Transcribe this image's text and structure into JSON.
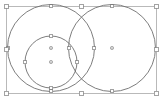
{
  "app": {
    "view_name": "vector-canvas",
    "background_color": "#ffffff"
  },
  "canvas": {
    "width": 162,
    "height": 104,
    "units": "px"
  },
  "selection": {
    "bbox": {
      "x": 6,
      "y": 6,
      "width": 150,
      "height": 87,
      "stroke_color": "#b9b9b9",
      "stroke_width": 1
    },
    "handle_style": {
      "size": 4,
      "fill": "#ffffff",
      "stroke": "#8c8c8c"
    },
    "handles": [
      {
        "name": "handle-top-left",
        "x": 6,
        "y": 6
      },
      {
        "name": "handle-top-center",
        "x": 81,
        "y": 6
      },
      {
        "name": "handle-top-right",
        "x": 156,
        "y": 6
      },
      {
        "name": "handle-middle-left",
        "x": 6,
        "y": 49.5
      },
      {
        "name": "handle-middle-right",
        "x": 156,
        "y": 49.5
      },
      {
        "name": "handle-bottom-left",
        "x": 6,
        "y": 93
      },
      {
        "name": "handle-bottom-center",
        "x": 81,
        "y": 93
      },
      {
        "name": "handle-bottom-right",
        "x": 156,
        "y": 93
      }
    ]
  },
  "shapes": [
    {
      "id": "circle-large-left",
      "type": "circle",
      "cx": 51,
      "cy": 48,
      "r": 43.5,
      "stroke_color": "#6e6e6e",
      "stroke_width": 0.9,
      "fill": "none"
    },
    {
      "id": "circle-large-right",
      "type": "circle",
      "cx": 112,
      "cy": 48,
      "r": 43.5,
      "stroke_color": "#6e6e6e",
      "stroke_width": 0.9,
      "fill": "none"
    },
    {
      "id": "circle-small",
      "type": "circle",
      "cx": 51,
      "cy": 62,
      "r": 26,
      "stroke_color": "#6e6e6e",
      "stroke_width": 0.9,
      "fill": "none"
    }
  ],
  "center_markers": [
    {
      "name": "center-marker-large-left",
      "x": 51,
      "y": 48
    },
    {
      "name": "center-marker-small",
      "x": 51,
      "y": 62
    },
    {
      "name": "center-marker-large-right",
      "x": 112,
      "y": 48
    }
  ],
  "node_handles": [
    {
      "name": "node-handle-small-top",
      "x": 51,
      "y": 36
    },
    {
      "name": "node-handle-small-right",
      "x": 77,
      "y": 62
    },
    {
      "name": "node-handle-small-bottom",
      "x": 51,
      "y": 88
    },
    {
      "name": "node-handle-small-left",
      "x": 25,
      "y": 62
    },
    {
      "name": "node-handle-left-top",
      "x": 51,
      "y": 6
    },
    {
      "name": "node-handle-left-right",
      "x": 94,
      "y": 48
    },
    {
      "name": "node-handle-left-bottom",
      "x": 51,
      "y": 91
    },
    {
      "name": "node-handle-left-left",
      "x": 8,
      "y": 48
    },
    {
      "name": "node-handle-right-top",
      "x": 112,
      "y": 6
    },
    {
      "name": "node-handle-right-left",
      "x": 69,
      "y": 48
    },
    {
      "name": "node-handle-right-bottom",
      "x": 112,
      "y": 91
    }
  ],
  "node_handle_style": {
    "size": 3,
    "fill": "#ffffff",
    "stroke": "#7a7a7a"
  }
}
